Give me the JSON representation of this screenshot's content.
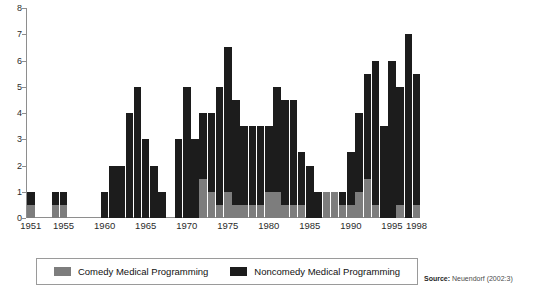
{
  "chart_data": {
    "type": "bar",
    "subtype": "stacked-bar",
    "title": "",
    "xlabel": "",
    "ylabel": "",
    "ylim": [
      0,
      8
    ],
    "yticks": [
      0,
      1,
      2,
      3,
      4,
      5,
      6,
      7,
      8
    ],
    "ytick_labels": [
      "0",
      "1",
      "2",
      "3",
      "4",
      "5",
      "6",
      "7",
      "8"
    ],
    "grid": false,
    "legend_position": "bottom-center",
    "x_start_year": 1951,
    "x_end_year": 1998,
    "xtick_labels": [
      "1951",
      "1955",
      "1960",
      "1965",
      "1970",
      "1975",
      "1980",
      "1985",
      "1990",
      "1995",
      "1998"
    ],
    "xticks": [
      1951,
      1955,
      1960,
      1965,
      1970,
      1975,
      1980,
      1985,
      1990,
      1995,
      1998
    ],
    "categories": [
      1951,
      1952,
      1953,
      1954,
      1955,
      1956,
      1957,
      1958,
      1959,
      1960,
      1961,
      1962,
      1963,
      1964,
      1965,
      1966,
      1967,
      1968,
      1969,
      1970,
      1971,
      1972,
      1973,
      1974,
      1975,
      1976,
      1977,
      1978,
      1979,
      1980,
      1981,
      1982,
      1983,
      1984,
      1985,
      1986,
      1987,
      1988,
      1989,
      1990,
      1991,
      1992,
      1993,
      1994,
      1995,
      1996,
      1997,
      1998
    ],
    "series": [
      {
        "name": "Comedy Medical Programming",
        "color": "#7d7d7d",
        "values": [
          0.5,
          0,
          0,
          0.5,
          0.5,
          0,
          0,
          0,
          0,
          0,
          0,
          0,
          0,
          0,
          0,
          0,
          0,
          0,
          0,
          0,
          0,
          1.5,
          1,
          0.5,
          1,
          0.5,
          0.5,
          0.5,
          0.5,
          1,
          1,
          0.5,
          0.5,
          0.5,
          0,
          0,
          1,
          1,
          0.5,
          0.5,
          1,
          1.5,
          0.5,
          0,
          0,
          0.5,
          0,
          0.5
        ]
      },
      {
        "name": "Noncomedy Medical Programming",
        "color": "#1c1c1c",
        "values": [
          0.5,
          0,
          0,
          0.5,
          0.5,
          0,
          0,
          0,
          0,
          1,
          2,
          2,
          4,
          5,
          3,
          2,
          1,
          0,
          3,
          5,
          3,
          2.5,
          3,
          4.5,
          5.5,
          4,
          3,
          3,
          3,
          2.5,
          4,
          4,
          4,
          2,
          2,
          1,
          0,
          0,
          0.5,
          2,
          3,
          4,
          5.5,
          3.5,
          6,
          4.5,
          7,
          5
        ]
      }
    ],
    "totals": [
      1,
      0,
      0,
      1,
      1,
      0,
      0,
      0,
      0,
      1,
      2,
      2,
      4,
      5,
      3,
      2,
      1,
      0,
      3,
      5,
      3,
      4,
      4,
      5,
      6.5,
      4.5,
      3.5,
      3.5,
      3.5,
      3.5,
      5,
      4.5,
      4.5,
      2.5,
      2,
      1,
      1,
      1,
      1,
      2.5,
      4,
      5.5,
      6,
      3.5,
      6,
      5,
      7,
      5.5
    ]
  },
  "axis": {
    "y_ticks": [
      "0",
      "1",
      "2",
      "3",
      "4",
      "5",
      "6",
      "7",
      "8"
    ],
    "x_ticks": [
      {
        "label": "1951",
        "year": 1951
      },
      {
        "label": "1955",
        "year": 1955
      },
      {
        "label": "1960",
        "year": 1960
      },
      {
        "label": "1965",
        "year": 1965
      },
      {
        "label": "1970",
        "year": 1970
      },
      {
        "label": "1975",
        "year": 1975
      },
      {
        "label": "1980",
        "year": 1980
      },
      {
        "label": "1985",
        "year": 1985
      },
      {
        "label": "1990",
        "year": 1990
      },
      {
        "label": "1995",
        "year": 1995
      },
      {
        "label": "1998",
        "year": 1998
      }
    ]
  },
  "legend": {
    "entries": [
      {
        "label": "Comedy Medical Programming",
        "color": "#7d7d7d",
        "swatch_name": "comedy-swatch"
      },
      {
        "label": "Noncomedy Medical Programming",
        "color": "#1c1c1c",
        "swatch_name": "noncomedy-swatch"
      }
    ]
  },
  "source": {
    "bold_prefix": "Source:",
    "text": " Neuendorf (2002:3)"
  },
  "colors": {
    "comedy": "#7d7d7d",
    "noncomedy": "#1c1c1c",
    "axis": "#8e8e8e",
    "text": "#2b2b2b",
    "background": "#ffffff",
    "legend_border": "#9a9a9a"
  }
}
